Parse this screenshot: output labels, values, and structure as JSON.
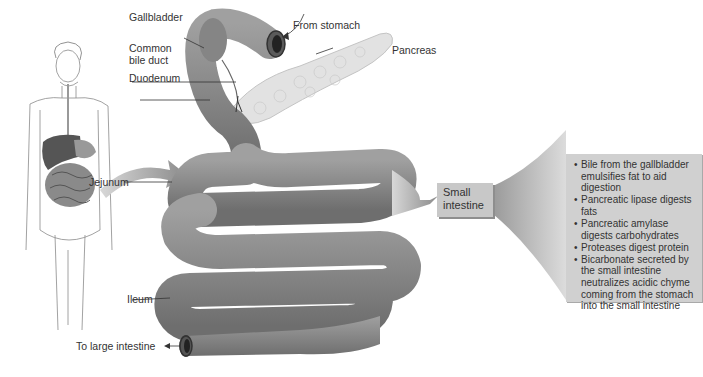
{
  "figure": {
    "labels": {
      "gallbladder": "Gallbladder",
      "common_bile_duct": "Common bile duct",
      "duodenum": "Duodenum",
      "from_stomach": "From stomach",
      "pancreas": "Pancreas",
      "jejunum": "Jejunum",
      "ileum": "Ileum",
      "to_large_intestine": "To large intestine"
    },
    "small_intestine_box": {
      "line1": "Small",
      "line2": "intestine"
    },
    "info_box": {
      "items": [
        "Bile from the gallbladder emulsifies fat to aid digestion",
        "Pancreatic lipase digests fats",
        "Pancreatic amylase digests carbohydrates",
        "Proteases digest protein",
        "Bicarbonate secreted by the small intestine neutralizes acidic chyme coming from the stomach into the small intestine"
      ]
    },
    "colors": {
      "intestine": "#8a8a8a",
      "pancreas": "#dcdcdc",
      "box_fill": "#c8c8c8",
      "info_fill": "#d0d0d0"
    }
  }
}
